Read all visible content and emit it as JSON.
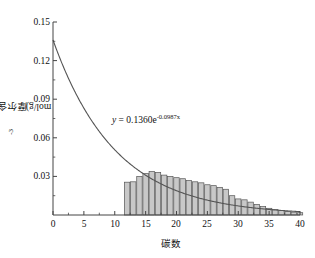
{
  "chart_data": {
    "type": "bar",
    "title": "",
    "subtitle": "",
    "xlabel": "碳数",
    "ylabel": "摩尔含量/(10⁻³mol/g)",
    "ylabel_text": "摩尔含量/(10",
    "ylabel_exp": "-3",
    "ylabel_tail": "mol/g)",
    "xlim": [
      0,
      40
    ],
    "ylim": [
      0,
      0.15
    ],
    "grid": false,
    "legend": null,
    "xticks": [
      0,
      5,
      10,
      15,
      20,
      25,
      30,
      35,
      40
    ],
    "xtick_labels": [
      "0",
      "5",
      "10",
      "15",
      "20",
      "25",
      "30",
      "35",
      "40"
    ],
    "yticks": [
      0.03,
      0.06,
      0.09,
      0.12,
      0.15
    ],
    "ytick_labels": [
      "0.03",
      "0.06",
      "0.09",
      "0.12",
      "0.15"
    ],
    "minor_ticks": true,
    "bar_color": "#c8c8c8",
    "bar_edge_color": "#555555",
    "line_color": "#555555",
    "axis_color": "#444444",
    "categories": [
      12,
      13,
      14,
      15,
      16,
      17,
      18,
      19,
      20,
      21,
      22,
      23,
      24,
      25,
      26,
      27,
      28,
      29,
      30,
      31,
      32,
      33,
      34,
      35,
      36,
      37,
      38,
      39,
      40
    ],
    "values": [
      0.0255,
      0.0258,
      0.03,
      0.0322,
      0.0338,
      0.033,
      0.031,
      0.03,
      0.029,
      0.0282,
      0.0268,
      0.0258,
      0.025,
      0.0235,
      0.0228,
      0.0215,
      0.02,
      0.015,
      0.0125,
      0.0118,
      0.01,
      0.0082,
      0.0065,
      0.0052,
      0.0042,
      0.0035,
      0.0028,
      0.0022,
      0.0018
    ],
    "curve": {
      "kind": "exponential",
      "a": 0.136,
      "b": -0.0987,
      "equation_y": "y",
      "equation_eq": " = 0.1360e",
      "equation_exp": "-0.0987x",
      "equation_full": "y = 0.1360e^(-0.0987x)",
      "x_from": 0,
      "x_to": 40
    },
    "annotations": [
      {
        "name": "fit-equation",
        "text": "y = 0.1360e^(-0.0987x)",
        "x": 11.5,
        "y": 0.068
      }
    ]
  }
}
